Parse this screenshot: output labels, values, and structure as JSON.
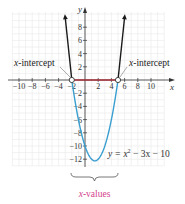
{
  "figure": {
    "axes": {
      "x_label": "x",
      "y_label": "y",
      "x_ticks": [
        "−10",
        "−8",
        "−6",
        "−4",
        "−2",
        "2",
        "4",
        "6",
        "8",
        "10"
      ],
      "y_ticks": [
        "8",
        "6",
        "4",
        "2",
        "−2",
        "−4",
        "−6",
        "−8",
        "−10",
        "−12"
      ]
    },
    "callouts": {
      "left_intercept": {
        "var": "x",
        "text": "-intercept"
      },
      "right_intercept": {
        "var": "x",
        "text": "-intercept"
      }
    },
    "equation": {
      "lhs": "y = x",
      "exp": "2",
      "rhs": " − 3x − 10"
    },
    "brace_label": {
      "var": "x",
      "text": "-values"
    },
    "colors": {
      "curve_below": "#3a9fd0",
      "curve_above": "#1a1a1a",
      "interval": "#a8323c",
      "brace_label": "#d4408c",
      "grid": "#e8e8e8"
    }
  },
  "chart_data": {
    "type": "line",
    "title": "",
    "function": "y = x^2 - 3x - 10",
    "xlabel": "x",
    "ylabel": "y",
    "xlim": [
      -11,
      12
    ],
    "ylim": [
      -13,
      10
    ],
    "grid": true,
    "x_intercepts": [
      -2,
      5
    ],
    "vertex": [
      1.5,
      -12.25
    ],
    "highlighted_interval": [
      -2,
      5
    ],
    "x": [
      -3,
      -2,
      -1,
      0,
      1,
      1.5,
      2,
      3,
      4,
      5,
      6
    ],
    "y": [
      8,
      0,
      -6,
      -10,
      -12,
      -12.25,
      -12,
      -10,
      -6,
      0,
      8
    ],
    "annotations": [
      "x-intercept",
      "x-intercept",
      "y = x² − 3x − 10",
      "x-values"
    ]
  }
}
